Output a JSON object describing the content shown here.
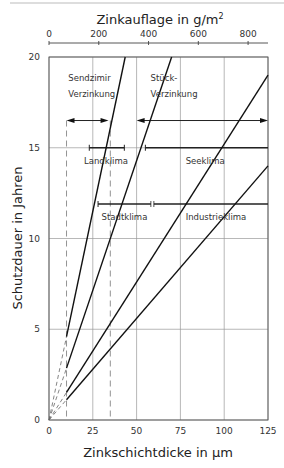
{
  "chart_data": {
    "type": "line",
    "title": "",
    "top_axis": {
      "label": "Zinkauflage in g/m²",
      "ticks": [
        0,
        200,
        400,
        600,
        800
      ],
      "range": [
        0,
        880
      ]
    },
    "xlabel": "Zinkschichtdicke in µm",
    "ylabel": "Schutzdauer in Jahren",
    "xlim": [
      0,
      125
    ],
    "ylim": [
      0,
      20
    ],
    "xticks": [
      0,
      25,
      50,
      75,
      100,
      125
    ],
    "yticks": [
      0,
      5,
      10,
      15,
      20
    ],
    "grid": true,
    "dashed_verticals_um": [
      10,
      35
    ],
    "series": [
      {
        "name": "Landklima",
        "x": [
          0,
          43.5
        ],
        "y": [
          0,
          20
        ],
        "solid_from_um": 10
      },
      {
        "name": "Stadtklima",
        "x": [
          0,
          70
        ],
        "y": [
          0,
          20
        ],
        "solid_from_um": 10
      },
      {
        "name": "Seeklima",
        "x": [
          0,
          125
        ],
        "y": [
          0,
          19
        ],
        "solid_from_um": 10
      },
      {
        "name": "Industrieklima",
        "x": [
          0,
          125
        ],
        "y": [
          0,
          14
        ],
        "solid_from_um": 10
      }
    ],
    "ranges": [
      {
        "name": "Sendzimir Verzinkung",
        "type": "double-arrow",
        "x": [
          10,
          34
        ],
        "y": 16.5
      },
      {
        "name": "Stück-Verzinkung",
        "type": "double-arrow",
        "x": [
          50,
          125
        ],
        "y": 16.5
      },
      {
        "name": "Landklima range",
        "type": "bar",
        "x": [
          23,
          43
        ],
        "y": 15
      },
      {
        "name": "Seeklima range",
        "type": "bar",
        "x": [
          55,
          125
        ],
        "y": 15
      },
      {
        "name": "Stadtklima range",
        "type": "bar",
        "x": [
          28,
          125
        ],
        "y": 11.9,
        "break_at": 59
      }
    ],
    "annotations": [
      {
        "text": "Sendzimir",
        "x": 11,
        "y": 18.7
      },
      {
        "text": "Verzinkung",
        "x": 11,
        "y": 17.8
      },
      {
        "text": "Stück-",
        "x": 58,
        "y": 18.7
      },
      {
        "text": "Verzinkung",
        "x": 58,
        "y": 17.8
      },
      {
        "text": "Landklima",
        "x": 20,
        "y": 14.1
      },
      {
        "text": "Seeklima",
        "x": 78,
        "y": 14.1
      },
      {
        "text": "Stadtklima",
        "x": 30,
        "y": 11.0
      },
      {
        "text": "Industrieklima",
        "x": 78,
        "y": 11.0
      }
    ]
  },
  "labels": {
    "top_axis_title": "Zinkauflage in g/m",
    "top_axis_sup": "2",
    "x_title": "Zinkschichtdicke in µm",
    "y_title": "Schutzdauer in Jahren"
  }
}
